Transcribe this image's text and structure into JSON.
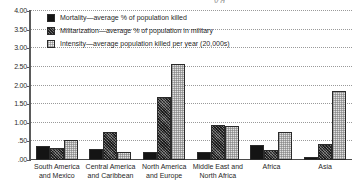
{
  "chart_data": {
    "type": "bar",
    "title": "",
    "xlabel": "",
    "ylabel": "",
    "ylim": [
      0,
      4.0
    ],
    "grid": true,
    "legend_position": "top-left",
    "categories": [
      "South America\nand Mexico",
      "Central America\nand Caribbean",
      "North America\nand Europe",
      "Middle East and\nNorth Africa",
      "Africa",
      "Asia"
    ],
    "ytick_labels": [
      ".00",
      ".50",
      "1.00",
      "1.50",
      "2.00",
      "2.50",
      "3.00",
      "3.50",
      "4.00"
    ],
    "ytick_values": [
      0,
      0.5,
      1.0,
      1.5,
      2.0,
      2.5,
      3.0,
      3.5,
      4.0
    ],
    "series": [
      {
        "name": "Mortality—average % of population killed",
        "key": "mortality",
        "color": "#141414",
        "values": [
          0.38,
          0.3,
          0.21,
          0.21,
          0.41,
          0.07
        ]
      },
      {
        "name": "Militarization—average % of population in military",
        "key": "militarization",
        "color": "#4e4e4e",
        "values": [
          0.33,
          0.75,
          1.68,
          0.94,
          0.26,
          0.44
        ]
      },
      {
        "name": "Intensity—average population killed per year (20,000s)",
        "key": "intensity",
        "color": "#e2e2e2",
        "values": [
          0.55,
          0.21,
          2.57,
          0.91,
          0.76,
          1.86
        ]
      }
    ]
  },
  "clipped_title_fragment": "y g"
}
